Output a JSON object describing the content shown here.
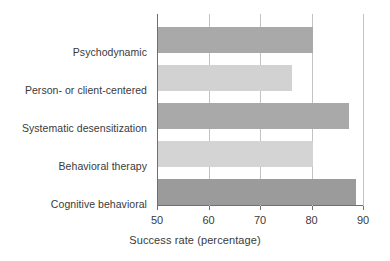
{
  "chart_data": {
    "type": "bar",
    "orientation": "horizontal",
    "title": "",
    "xlabel": "Success rate (percentage)",
    "ylabel": "",
    "xlim": [
      50,
      90
    ],
    "xticks": [
      50,
      60,
      70,
      80,
      90
    ],
    "xtick_labels": [
      "50",
      "60",
      "70",
      "80",
      "90"
    ],
    "grid": "vertical",
    "legend": "none",
    "categories": [
      "Psychodynamic",
      "Person- or client-centered",
      "Systematic desensitization",
      "Behavioral therapy",
      "Cognitive behavioral"
    ],
    "values": [
      80,
      76,
      87,
      80,
      88.5
    ],
    "bar_colors": [
      "#a9a9a9",
      "#d2d2d2",
      "#a9a9a9",
      "#d4d4d4",
      "#9b9b9b"
    ],
    "axis_color": "#6f6f6f",
    "gridline_color": "#c3c3c3",
    "text_color": "#3a3a3a",
    "background": "#ffffff"
  }
}
